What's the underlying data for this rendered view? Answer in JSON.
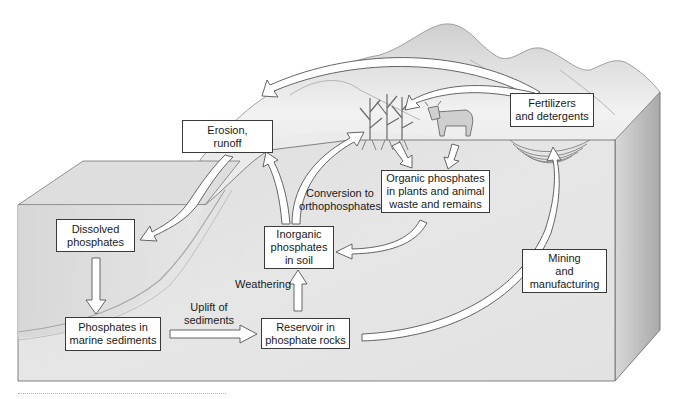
{
  "diagram": {
    "type": "phosphorus-cycle",
    "colors": {
      "background": "#ffffff",
      "cube_front": "#e4e4e4",
      "cube_top": "#d9d9d9",
      "cube_side": "#bdbdbd",
      "mountain": "#e8e8e8",
      "box_fill": "#ffffff",
      "box_border": "#3a3a3a",
      "arrow_fill": "#ffffff",
      "arrow_stroke": "#555555"
    },
    "nodes": {
      "erosion": "Erosion,\nrunoff",
      "fertilizers": "Fertilizers\nand detergents",
      "dissolved": "Dissolved\nphosphates",
      "organic": "Organic phosphates\nin plants and animal\nwaste and remains",
      "inorganic": "Inorganic\nphosphates\nin soil",
      "mining": "Mining\nand\nmanufacturing",
      "marine": "Phosphates in\nmarine sediments",
      "reservoir": "Reservoir in\nphosphate rocks"
    },
    "edge_labels": {
      "conversion": "Conversion to\northophosphates",
      "weathering": "Weathering",
      "uplift": "Uplift of\nsediments"
    },
    "edges": [
      {
        "from": "Fertilizers and detergents",
        "to": "Erosion, runoff"
      },
      {
        "from": "Fertilizers and detergents",
        "to": "Plants"
      },
      {
        "from": "Erosion, runoff",
        "to": "Dissolved phosphates"
      },
      {
        "from": "Dissolved phosphates",
        "to": "Phosphates in marine sediments"
      },
      {
        "from": "Phosphates in marine sediments",
        "to": "Reservoir in phosphate rocks",
        "label": "Uplift of sediments"
      },
      {
        "from": "Reservoir in phosphate rocks",
        "to": "Inorganic phosphates in soil",
        "label": "Weathering"
      },
      {
        "from": "Inorganic phosphates in soil",
        "to": "Erosion, runoff"
      },
      {
        "from": "Inorganic phosphates in soil",
        "to": "Plants"
      },
      {
        "from": "Plants",
        "to": "Organic phosphates in plants and animal waste and remains"
      },
      {
        "from": "Animal",
        "to": "Organic phosphates in plants and animal waste and remains"
      },
      {
        "from": "Organic phosphates in plants and animal waste and remains",
        "to": "Inorganic phosphates in soil",
        "label": "Conversion to orthophosphates"
      },
      {
        "from": "Reservoir in phosphate rocks",
        "to": "Fertilizers and detergents",
        "label": "Mining and manufacturing"
      }
    ]
  }
}
